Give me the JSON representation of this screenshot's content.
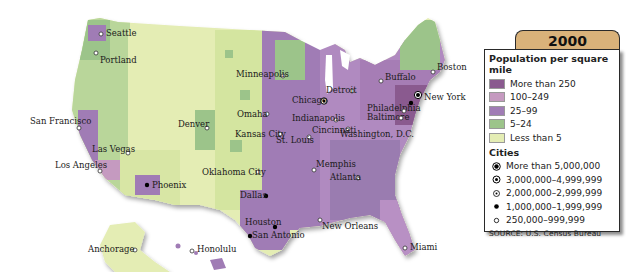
{
  "legend": {
    "year": "2000",
    "density_title": "Population per square mile",
    "density_classes": [
      {
        "label": "More than 250",
        "color": "#8a5a8f"
      },
      {
        "label": "100–249",
        "color": "#c59ac0"
      },
      {
        "label": "25–99",
        "color": "#a07cb5"
      },
      {
        "label": "5–24",
        "color": "#9cc48a"
      },
      {
        "label": "Less than 5",
        "color": "#e4edb4"
      }
    ],
    "cities_title": "Cities",
    "city_classes": [
      {
        "label": "More than 5,000,000",
        "symbol": "large-target-dot"
      },
      {
        "label": "3,000,000–4,999,999",
        "symbol": "ring-dot"
      },
      {
        "label": "2,000,000–2,999,999",
        "symbol": "small-ring-dot"
      },
      {
        "label": "1,000,000–1,999,999",
        "symbol": "black-dot"
      },
      {
        "label": "250,000–999,999",
        "symbol": "open-dot"
      }
    ],
    "source": "SOURCE: U.S. Census Bureau"
  },
  "cities": [
    {
      "name": "Seattle",
      "x": 101,
      "y": 34,
      "symbol": "open-dot",
      "lx": 106,
      "ly": 36
    },
    {
      "name": "Portland",
      "x": 96,
      "y": 53,
      "symbol": "open-dot",
      "lx": 100,
      "ly": 63
    },
    {
      "name": "San Francisco",
      "x": 79,
      "y": 128,
      "symbol": "open-dot",
      "lx": 30,
      "ly": 124
    },
    {
      "name": "Las Vegas",
      "x": 128,
      "y": 153,
      "symbol": "open-dot",
      "lx": 92,
      "ly": 152
    },
    {
      "name": "Los Angeles",
      "x": 100,
      "y": 171,
      "symbol": "open-dot",
      "lx": 55,
      "ly": 168
    },
    {
      "name": "Phoenix",
      "x": 147,
      "y": 185,
      "symbol": "black-dot",
      "lx": 152,
      "ly": 188
    },
    {
      "name": "Denver",
      "x": 207,
      "y": 128,
      "symbol": "open-dot",
      "lx": 178,
      "ly": 127
    },
    {
      "name": "Minneapolis",
      "x": 283,
      "y": 76,
      "symbol": "open-dot",
      "lx": 236,
      "ly": 77
    },
    {
      "name": "Omaha",
      "x": 267,
      "y": 114,
      "symbol": "open-dot",
      "lx": 237,
      "ly": 117
    },
    {
      "name": "Kansas City",
      "x": 280,
      "y": 134,
      "symbol": "open-dot",
      "lx": 235,
      "ly": 137
    },
    {
      "name": "Oklahoma City",
      "x": 258,
      "y": 172,
      "symbol": "open-dot",
      "lx": 202,
      "ly": 175
    },
    {
      "name": "Dallas",
      "x": 266,
      "y": 196,
      "symbol": "black-dot",
      "lx": 240,
      "ly": 198
    },
    {
      "name": "Houston",
      "x": 275,
      "y": 227,
      "symbol": "black-dot",
      "lx": 245,
      "ly": 225
    },
    {
      "name": "San Antonio",
      "x": 250,
      "y": 236,
      "symbol": "black-dot",
      "lx": 252,
      "ly": 238
    },
    {
      "name": "Chicago",
      "x": 324,
      "y": 101,
      "symbol": "ring-dot",
      "lx": 292,
      "ly": 103
    },
    {
      "name": "Detroit",
      "x": 352,
      "y": 91,
      "symbol": "open-dot",
      "lx": 326,
      "ly": 93
    },
    {
      "name": "Indianapolis",
      "x": 336,
      "y": 120,
      "symbol": "open-dot",
      "lx": 292,
      "ly": 121
    },
    {
      "name": "Cincinnati",
      "x": 348,
      "y": 129,
      "symbol": "open-dot",
      "lx": 312,
      "ly": 133
    },
    {
      "name": "St. Louis",
      "x": 309,
      "y": 137,
      "symbol": "open-dot",
      "lx": 276,
      "ly": 143
    },
    {
      "name": "Memphis",
      "x": 314,
      "y": 170,
      "symbol": "open-dot",
      "lx": 316,
      "ly": 167
    },
    {
      "name": "Atlanta",
      "x": 358,
      "y": 178,
      "symbol": "open-dot",
      "lx": 330,
      "ly": 180
    },
    {
      "name": "New Orleans",
      "x": 320,
      "y": 220,
      "symbol": "open-dot",
      "lx": 322,
      "ly": 229
    },
    {
      "name": "Miami",
      "x": 405,
      "y": 248,
      "symbol": "open-dot",
      "lx": 410,
      "ly": 250
    },
    {
      "name": "Buffalo",
      "x": 381,
      "y": 81,
      "symbol": "open-dot",
      "lx": 385,
      "ly": 80
    },
    {
      "name": "Boston",
      "x": 433,
      "y": 72,
      "symbol": "open-dot",
      "lx": 437,
      "ly": 70
    },
    {
      "name": "New York",
      "x": 418,
      "y": 95,
      "symbol": "large-target-dot",
      "lx": 424,
      "ly": 100
    },
    {
      "name": "Philadelphia",
      "x": 411,
      "y": 103,
      "symbol": "black-dot",
      "lx": 367,
      "ly": 111
    },
    {
      "name": "Baltimore",
      "x": 404,
      "y": 111,
      "symbol": "open-dot",
      "lx": 367,
      "ly": 120
    },
    {
      "name": "Washington, D.C.",
      "x": 401,
      "y": 118,
      "symbol": "open-dot",
      "lx": 340,
      "ly": 137
    },
    {
      "name": "Anchorage",
      "x": 135,
      "y": 250,
      "symbol": "open-dot",
      "lx": 88,
      "ly": 252
    },
    {
      "name": "Honolulu",
      "x": 192,
      "y": 251,
      "symbol": "open-dot",
      "lx": 197,
      "ly": 252
    }
  ]
}
